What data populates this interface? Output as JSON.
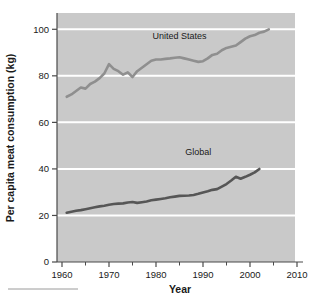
{
  "chart_data": {
    "type": "line",
    "title": "",
    "xlabel": "Year",
    "ylabel": "Per capita meat consumption (kg)",
    "xlim": [
      1958,
      2012
    ],
    "ylim": [
      0,
      107
    ],
    "xticks": [
      1960,
      1970,
      1980,
      1990,
      2000,
      2010
    ],
    "xticklabels": [
      "1960",
      "1970",
      "1980",
      "1990",
      "2000",
      "2010"
    ],
    "xminorticks": [
      1965,
      1975,
      1985,
      1995,
      2005
    ],
    "yticks": [
      0,
      20,
      40,
      60,
      80,
      100
    ],
    "yticklabels": [
      "0",
      "20",
      "40",
      "60",
      "80",
      "100"
    ],
    "grid": "horizontal-white-gridlines",
    "legend": "inline-series-labels",
    "plot_background": "#c9c9c9",
    "gridline_color": "#ffffff",
    "series": [
      {
        "name": "United States",
        "label": "United States",
        "color": "#8f8f8f",
        "label_x": 1985,
        "label_y": 96,
        "x": [
          1961,
          1962,
          1963,
          1964,
          1965,
          1966,
          1967,
          1968,
          1969,
          1970,
          1971,
          1972,
          1973,
          1974,
          1975,
          1976,
          1977,
          1978,
          1979,
          1980,
          1981,
          1982,
          1983,
          1984,
          1985,
          1986,
          1987,
          1988,
          1989,
          1990,
          1991,
          1992,
          1993,
          1994,
          1995,
          1996,
          1997,
          1998,
          1999,
          2000,
          2001,
          2002,
          2003,
          2004
        ],
        "values": [
          71.0,
          72.0,
          73.5,
          75.0,
          74.5,
          76.5,
          77.5,
          79.0,
          81.0,
          85.0,
          83.0,
          82.0,
          80.5,
          81.5,
          79.5,
          82.0,
          83.5,
          85.0,
          86.5,
          87.0,
          87.0,
          87.3,
          87.5,
          87.8,
          88.0,
          87.5,
          87.0,
          86.5,
          86.0,
          86.3,
          87.5,
          89.0,
          89.5,
          91.0,
          92.0,
          92.5,
          93.0,
          94.5,
          96.0,
          97.0,
          97.5,
          98.5,
          99.0,
          100.0
        ]
      },
      {
        "name": "Global",
        "label": "Global",
        "color": "#565656",
        "label_x": 1989,
        "label_y": 46,
        "x": [
          1961,
          1962,
          1963,
          1964,
          1965,
          1966,
          1967,
          1968,
          1969,
          1970,
          1971,
          1972,
          1973,
          1974,
          1975,
          1976,
          1977,
          1978,
          1979,
          1980,
          1981,
          1982,
          1983,
          1984,
          1985,
          1986,
          1987,
          1988,
          1989,
          1990,
          1991,
          1992,
          1993,
          1994,
          1995,
          1996,
          1997,
          1998,
          1999,
          2000,
          2001,
          2002
        ],
        "values": [
          21.2,
          21.6,
          22.0,
          22.3,
          22.7,
          23.1,
          23.5,
          23.9,
          24.2,
          24.6,
          24.9,
          25.1,
          25.2,
          25.6,
          25.8,
          25.4,
          25.7,
          26.0,
          26.5,
          26.8,
          27.1,
          27.4,
          27.8,
          28.1,
          28.4,
          28.5,
          28.6,
          28.8,
          29.3,
          29.9,
          30.4,
          31.0,
          31.3,
          32.4,
          33.5,
          35.0,
          36.6,
          35.8,
          36.6,
          37.5,
          38.5,
          40.0
        ]
      }
    ]
  },
  "axis": {
    "y_title": "Per capita meat consumption (kg)",
    "x_title": "Year"
  },
  "artifact": {
    "bottom_rule": ""
  }
}
